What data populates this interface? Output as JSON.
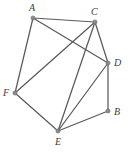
{
  "figure": {
    "type": "undirected-graph-diagram",
    "background_color": "#ffffff",
    "edge_color": "#5a5a5a",
    "vertex_color": "#8a8a8a",
    "label_color": "#3d3d3d",
    "width": 132,
    "height": 154
  },
  "vertices": [
    {
      "id": "A",
      "label": "A",
      "x": 33,
      "y": 18,
      "label_x": 29,
      "label_y": 3
    },
    {
      "id": "C",
      "label": "C",
      "x": 95,
      "y": 22,
      "label_x": 91,
      "label_y": 7
    },
    {
      "id": "D",
      "label": "D",
      "x": 108,
      "y": 63,
      "label_x": 114,
      "label_y": 58
    },
    {
      "id": "B",
      "label": "B",
      "x": 108,
      "y": 111,
      "label_x": 114,
      "label_y": 107
    },
    {
      "id": "E",
      "label": "E",
      "x": 58,
      "y": 131,
      "label_x": 55,
      "label_y": 137
    },
    {
      "id": "F",
      "label": "F",
      "x": 15,
      "y": 93,
      "label_x": 3,
      "label_y": 88
    }
  ],
  "edges": [
    {
      "from": "A",
      "to": "C"
    },
    {
      "from": "A",
      "to": "F"
    },
    {
      "from": "A",
      "to": "D"
    },
    {
      "from": "C",
      "to": "D"
    },
    {
      "from": "C",
      "to": "E"
    },
    {
      "from": "C",
      "to": "F"
    },
    {
      "from": "D",
      "to": "B"
    },
    {
      "from": "D",
      "to": "E"
    },
    {
      "from": "E",
      "to": "B"
    },
    {
      "from": "E",
      "to": "F"
    }
  ]
}
